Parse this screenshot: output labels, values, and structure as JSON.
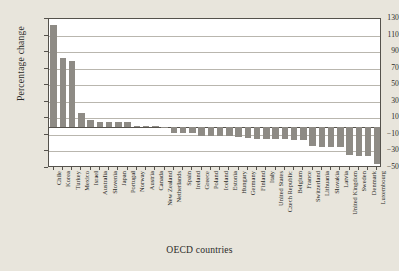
{
  "chart_data": {
    "type": "bar",
    "title": "",
    "xlabel": "OECD countries",
    "ylabel": "Percentage change",
    "ylim": [
      -50,
      130
    ],
    "yticks": [
      130,
      110,
      90,
      70,
      50,
      30,
      10,
      -10,
      -30,
      -50
    ],
    "ytick_labels": [
      "130",
      "110",
      "90",
      "70",
      "50",
      "30",
      "10",
      "−10",
      "−30",
      "−50"
    ],
    "grid": true,
    "legend": "none",
    "bar_color": "#8e8b85",
    "plot_background": "#ffffff",
    "page_background": "#e8e5dc",
    "categories": [
      "Chile",
      "Korea",
      "Turkey",
      "Mexico",
      "Israel",
      "Australia",
      "Slovenia",
      "Japan",
      "Portugal",
      "Norway",
      "Austria",
      "Canada",
      "New Zealand",
      "Netherlands",
      "Spain",
      "Ireland",
      "Greece",
      "Poland",
      "Iceland",
      "Estonia",
      "Hungary",
      "Germany",
      "Finland",
      "Italy",
      "United States",
      "Czech Republic",
      "Belgium",
      "France",
      "Switzerland",
      "Lithuania",
      "Slovakia",
      "Latvia",
      "United Kingdom",
      "Sweden",
      "Denmark",
      "Luxembourg"
    ],
    "values": [
      123,
      83,
      79,
      16,
      8,
      6,
      6,
      5,
      5,
      1,
      0.5,
      0.5,
      -1,
      -8,
      -8,
      -8,
      -11,
      -11,
      -11,
      -11,
      -13,
      -14,
      -15,
      -15,
      -15,
      -15,
      -16,
      -16,
      -24,
      -25,
      -25,
      -25,
      -34,
      -35,
      -35,
      -45
    ]
  }
}
